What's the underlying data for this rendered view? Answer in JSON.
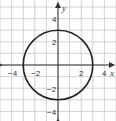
{
  "chart_data": {
    "type": "line",
    "title": "",
    "xlabel": "x",
    "ylabel": "y",
    "xlim": [
      -5,
      5
    ],
    "ylim": [
      -5,
      5
    ],
    "grid": true,
    "x_ticks": [
      -4,
      -2,
      2,
      4
    ],
    "y_ticks": [
      4,
      2,
      -2,
      -4
    ],
    "x_tick_labels": [
      "−4",
      "−2",
      "2",
      "4"
    ],
    "y_tick_labels": [
      "4",
      "2",
      "−2",
      "−4"
    ],
    "series": [
      {
        "name": "circle",
        "shape": "circle",
        "center": [
          0,
          0
        ],
        "radius": 3,
        "equation": "x^2 + y^2 = 9",
        "color": "#222222"
      }
    ]
  },
  "labels": {
    "x_axis": "x",
    "y_axis": "y",
    "xt0": "−4",
    "xt1": "−2",
    "xt2": "2",
    "xt3": "4",
    "yt0": "4",
    "yt1": "2",
    "yt2": "−2",
    "yt3": "−4"
  }
}
